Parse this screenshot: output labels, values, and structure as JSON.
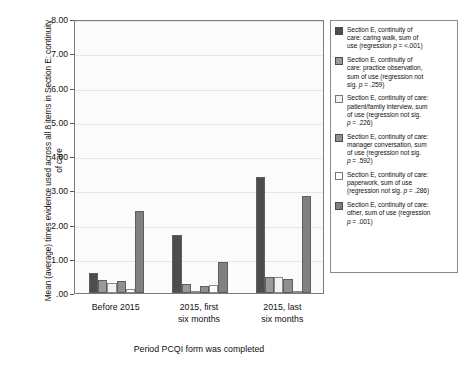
{
  "chart_data": {
    "type": "bar",
    "title": "",
    "xlabel": "Period PCQI form was completed",
    "ylabel": "Mean (average) times evidence used across all 8 items in Section E: continuity of care",
    "categories": [
      "Before 2015",
      "2015, first six months",
      "2015, last six months"
    ],
    "ylim": [
      0,
      8
    ],
    "yticks": [
      ".00",
      "1.00",
      "2.00",
      "3.00",
      "4.00",
      "5.00",
      "6.00",
      "7.00",
      "8.00"
    ],
    "ytick_values": [
      0,
      1,
      2,
      3,
      4,
      5,
      6,
      7,
      8
    ],
    "grid": true,
    "legend_position": "right",
    "series": [
      {
        "name": "Section E, continuity of care: caring walk, sum of use (regression p = <.001)",
        "color": "#4d4d4d",
        "values": [
          0.58,
          1.68,
          3.4
        ]
      },
      {
        "name": "Section E, continuity of care: practice observation, sum of use (regression not sig. p = .259)",
        "color": "#9a9a9a",
        "values": [
          0.38,
          0.27,
          0.48
        ]
      },
      {
        "name": "Section E, continuity of care: patient/family interview, sum of use (regression not sig. p = .226)",
        "color": "#f2f2f2",
        "values": [
          0.3,
          0.05,
          0.46
        ]
      },
      {
        "name": "Section E, continuity of care: manager conversation, sum of use (regression not sig. p = .592)",
        "color": "#8f8f8f",
        "values": [
          0.36,
          0.21,
          0.4
        ]
      },
      {
        "name": "Section E, continuity of care: paperwork, sum of use (regression not sig. p = .286)",
        "color": "#ffffff",
        "values": [
          0.12,
          0.23,
          0.05
        ]
      },
      {
        "name": "Section E, continuity of care: other, sum of use (regression p = .001)",
        "color": "#808080",
        "values": [
          2.39,
          0.92,
          2.82
        ]
      }
    ]
  },
  "axes": {
    "y_title": "Mean (average) times evidence used across all 8 items in Section E: continuity of care",
    "x_title": "Period PCQI form was completed",
    "y_ticks": [
      ".00",
      "1.00",
      "2.00",
      "3.00",
      "4.00",
      "5.00",
      "6.00",
      "7.00",
      "8.00"
    ],
    "x_categories": [
      {
        "line1": "Before 2015",
        "line2": ""
      },
      {
        "line1": "2015, first",
        "line2": "six months"
      },
      {
        "line1": "2015, last",
        "line2": "six months"
      }
    ]
  },
  "legend": {
    "items": [
      {
        "color": "#4d4d4d",
        "line1": "Section E, continuity of",
        "line2": "care: caring walk, sum of",
        "line3": "use (regression p = <.001)"
      },
      {
        "color": "#9a9a9a",
        "line1": "Section E, continuity of",
        "line2": "care: practice observation,",
        "line3": "sum of use (regression not",
        "line4": "sig. p = .259)"
      },
      {
        "color": "#f2f2f2",
        "line1": "Section E, continuity of care:",
        "line2": "patient/family interview, sum",
        "line3": "of use (regression not sig.",
        "line4": "p = .226)"
      },
      {
        "color": "#8f8f8f",
        "line1": "Section E, continuity of care:",
        "line2": "manager conversation, sum",
        "line3": "of use (regression not sig.",
        "line4": "p = .592)"
      },
      {
        "color": "#ffffff",
        "line1": "Section E, continuity of care:",
        "line2": "paperwork, sum of use",
        "line3": "(regression not sig. p = .286)"
      },
      {
        "color": "#808080",
        "line1": "Section E, continuity of care:",
        "line2": "other, sum of use (regression",
        "line3": "p = .001)"
      }
    ]
  }
}
